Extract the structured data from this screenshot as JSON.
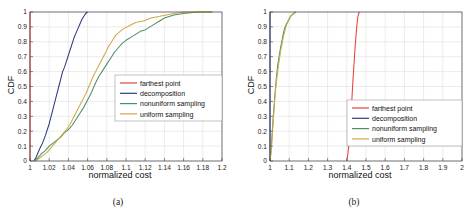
{
  "figure": {
    "subfigures": [
      {
        "caption": "(a)",
        "xlabel": "normalized cost",
        "ylabel": "CDF"
      },
      {
        "caption": "(b)",
        "xlabel": "normalized cost",
        "ylabel": "CDF"
      }
    ]
  },
  "colors": {
    "farthest_point": "#e8403a",
    "decomposition": "#2f3a7a",
    "nonuniform_sampling": "#4f8f62",
    "uniform_sampling": "#cfa94b",
    "axis": "#3f3f3f",
    "grid": "#d9d9d9",
    "background": "#ffffff"
  },
  "legend": {
    "entries": [
      {
        "label": "farthest point",
        "color_key": "farthest_point"
      },
      {
        "label": "decomposition",
        "color_key": "decomposition"
      },
      {
        "label": "nonuniform sampling",
        "color_key": "nonuniform_sampling"
      },
      {
        "label": "uniform sampling",
        "color_key": "uniform_sampling"
      }
    ]
  },
  "chart_data": [
    {
      "type": "line",
      "id": "subfigure-a",
      "title": "(a)",
      "xlabel": "normalized cost",
      "ylabel": "CDF",
      "xlim": [
        1,
        1.2
      ],
      "ylim": [
        0,
        1
      ],
      "grid": true,
      "legend_position": "center-right",
      "xticks": [
        1,
        1.02,
        1.04,
        1.06,
        1.08,
        1.1,
        1.12,
        1.14,
        1.16,
        1.18,
        1.2
      ],
      "xticklabels": [
        "1",
        "1.02",
        "1.04",
        "1.06",
        "1.08",
        "1.1",
        "1.12",
        "1.14",
        "1.16",
        "1.18",
        "1.2"
      ],
      "yticks": [
        0,
        0.1,
        0.2,
        0.3,
        0.4,
        0.5,
        0.6,
        0.7,
        0.8,
        0.9,
        1
      ],
      "yticklabels": [
        "0",
        "0.1",
        "0.2",
        "0.3",
        "0.4",
        "0.5",
        "0.6",
        "0.7",
        "0.8",
        "0.9",
        "1"
      ],
      "series": [
        {
          "name": "farthest point",
          "color": "#e8403a",
          "points": [
            [
              1,
              0
            ],
            [
              1,
              0.25
            ],
            [
              1,
              0.55
            ],
            [
              1,
              0.8
            ],
            [
              1,
              1
            ]
          ]
        },
        {
          "name": "decomposition",
          "color": "#2f3a7a",
          "points": [
            [
              1.004,
              0
            ],
            [
              1.006,
              0.02
            ],
            [
              1.008,
              0.05
            ],
            [
              1.01,
              0.08
            ],
            [
              1.013,
              0.12
            ],
            [
              1.016,
              0.17
            ],
            [
              1.018,
              0.21
            ],
            [
              1.02,
              0.25
            ],
            [
              1.022,
              0.3
            ],
            [
              1.024,
              0.35
            ],
            [
              1.026,
              0.4
            ],
            [
              1.028,
              0.45
            ],
            [
              1.03,
              0.5
            ],
            [
              1.032,
              0.55
            ],
            [
              1.034,
              0.6
            ],
            [
              1.036,
              0.63
            ],
            [
              1.038,
              0.67
            ],
            [
              1.04,
              0.71
            ],
            [
              1.042,
              0.75
            ],
            [
              1.044,
              0.79
            ],
            [
              1.046,
              0.83
            ],
            [
              1.048,
              0.86
            ],
            [
              1.05,
              0.89
            ],
            [
              1.052,
              0.92
            ],
            [
              1.054,
              0.95
            ],
            [
              1.056,
              0.97
            ],
            [
              1.058,
              0.99
            ],
            [
              1.06,
              1
            ]
          ]
        },
        {
          "name": "nonuniform sampling",
          "color": "#4f8f62",
          "points": [
            [
              1.004,
              0
            ],
            [
              1.008,
              0.02
            ],
            [
              1.012,
              0.05
            ],
            [
              1.016,
              0.07
            ],
            [
              1.02,
              0.1
            ],
            [
              1.024,
              0.12
            ],
            [
              1.028,
              0.14
            ],
            [
              1.032,
              0.16
            ],
            [
              1.036,
              0.19
            ],
            [
              1.04,
              0.21
            ],
            [
              1.044,
              0.24
            ],
            [
              1.048,
              0.28
            ],
            [
              1.052,
              0.32
            ],
            [
              1.056,
              0.36
            ],
            [
              1.06,
              0.41
            ],
            [
              1.064,
              0.46
            ],
            [
              1.068,
              0.52
            ],
            [
              1.072,
              0.57
            ],
            [
              1.076,
              0.61
            ],
            [
              1.08,
              0.65
            ],
            [
              1.084,
              0.69
            ],
            [
              1.088,
              0.73
            ],
            [
              1.092,
              0.76
            ],
            [
              1.096,
              0.79
            ],
            [
              1.1,
              0.81
            ],
            [
              1.105,
              0.83
            ],
            [
              1.11,
              0.85
            ],
            [
              1.115,
              0.87
            ],
            [
              1.12,
              0.88
            ],
            [
              1.125,
              0.9
            ],
            [
              1.13,
              0.92
            ],
            [
              1.135,
              0.94
            ],
            [
              1.14,
              0.96
            ],
            [
              1.15,
              0.98
            ],
            [
              1.16,
              0.99
            ],
            [
              1.175,
              1
            ],
            [
              1.19,
              1
            ]
          ]
        },
        {
          "name": "uniform sampling",
          "color": "#cfa94b",
          "points": [
            [
              1.006,
              0
            ],
            [
              1.01,
              0.02
            ],
            [
              1.014,
              0.04
            ],
            [
              1.018,
              0.06
            ],
            [
              1.022,
              0.09
            ],
            [
              1.026,
              0.12
            ],
            [
              1.03,
              0.15
            ],
            [
              1.034,
              0.18
            ],
            [
              1.038,
              0.21
            ],
            [
              1.042,
              0.25
            ],
            [
              1.046,
              0.3
            ],
            [
              1.05,
              0.35
            ],
            [
              1.054,
              0.4
            ],
            [
              1.058,
              0.45
            ],
            [
              1.062,
              0.51
            ],
            [
              1.066,
              0.57
            ],
            [
              1.07,
              0.62
            ],
            [
              1.074,
              0.67
            ],
            [
              1.078,
              0.72
            ],
            [
              1.082,
              0.77
            ],
            [
              1.086,
              0.81
            ],
            [
              1.09,
              0.85
            ],
            [
              1.094,
              0.87
            ],
            [
              1.098,
              0.89
            ],
            [
              1.104,
              0.91
            ],
            [
              1.11,
              0.93
            ],
            [
              1.118,
              0.94
            ],
            [
              1.126,
              0.96
            ],
            [
              1.134,
              0.97
            ],
            [
              1.142,
              0.98
            ],
            [
              1.15,
              0.99
            ],
            [
              1.16,
              1
            ],
            [
              1.19,
              1
            ]
          ]
        }
      ]
    },
    {
      "type": "line",
      "id": "subfigure-b",
      "title": "(b)",
      "xlabel": "normalized cost",
      "ylabel": "CDF",
      "xlim": [
        1,
        2
      ],
      "ylim": [
        0,
        1
      ],
      "grid": true,
      "legend_position": "lower-right",
      "xticks": [
        1,
        1.1,
        1.2,
        1.3,
        1.4,
        1.5,
        1.6,
        1.7,
        1.8,
        1.9,
        2
      ],
      "xticklabels": [
        "1",
        "1.1",
        "1.2",
        "1.3",
        "1.4",
        "1.5",
        "1.6",
        "1.7",
        "1.8",
        "1.9",
        "2"
      ],
      "yticks": [
        0,
        0.1,
        0.2,
        0.3,
        0.4,
        0.5,
        0.6,
        0.7,
        0.8,
        0.9,
        1
      ],
      "yticklabels": [
        "0",
        "0.1",
        "0.2",
        "0.3",
        "0.4",
        "0.5",
        "0.6",
        "0.7",
        "0.8",
        "0.9",
        "1"
      ],
      "series": [
        {
          "name": "farthest point",
          "color": "#e8403a",
          "points": [
            [
              1.4,
              0
            ],
            [
              1.405,
              0.04
            ],
            [
              1.41,
              0.1
            ],
            [
              1.414,
              0.17
            ],
            [
              1.418,
              0.24
            ],
            [
              1.422,
              0.31
            ],
            [
              1.425,
              0.38
            ],
            [
              1.428,
              0.45
            ],
            [
              1.431,
              0.52
            ],
            [
              1.434,
              0.58
            ],
            [
              1.437,
              0.64
            ],
            [
              1.44,
              0.7
            ],
            [
              1.443,
              0.76
            ],
            [
              1.446,
              0.81
            ],
            [
              1.449,
              0.86
            ],
            [
              1.452,
              0.9
            ],
            [
              1.455,
              0.94
            ],
            [
              1.458,
              0.97
            ],
            [
              1.462,
              0.99
            ],
            [
              1.466,
              1
            ]
          ]
        },
        {
          "name": "decomposition",
          "color": "#2f3a7a",
          "points": [
            [
              1,
              0
            ],
            [
              1,
              0.25
            ],
            [
              1,
              0.55
            ],
            [
              1,
              0.8
            ],
            [
              1,
              1
            ]
          ]
        },
        {
          "name": "nonuniform sampling",
          "color": "#4f8f62",
          "points": [
            [
              1.0,
              0
            ],
            [
              1.004,
              0.05
            ],
            [
              1.008,
              0.12
            ],
            [
              1.012,
              0.2
            ],
            [
              1.016,
              0.28
            ],
            [
              1.02,
              0.35
            ],
            [
              1.024,
              0.42
            ],
            [
              1.028,
              0.48
            ],
            [
              1.032,
              0.54
            ],
            [
              1.036,
              0.59
            ],
            [
              1.04,
              0.64
            ],
            [
              1.046,
              0.69
            ],
            [
              1.052,
              0.74
            ],
            [
              1.058,
              0.78
            ],
            [
              1.064,
              0.82
            ],
            [
              1.07,
              0.86
            ],
            [
              1.076,
              0.89
            ],
            [
              1.082,
              0.91
            ],
            [
              1.09,
              0.93
            ],
            [
              1.098,
              0.95
            ],
            [
              1.106,
              0.97
            ],
            [
              1.114,
              0.98
            ],
            [
              1.124,
              0.99
            ],
            [
              1.134,
              1
            ]
          ]
        },
        {
          "name": "uniform sampling",
          "color": "#cfa94b",
          "points": [
            [
              1.0,
              0
            ],
            [
              1.005,
              0.05
            ],
            [
              1.01,
              0.13
            ],
            [
              1.014,
              0.21
            ],
            [
              1.018,
              0.29
            ],
            [
              1.022,
              0.36
            ],
            [
              1.026,
              0.43
            ],
            [
              1.03,
              0.49
            ],
            [
              1.035,
              0.55
            ],
            [
              1.04,
              0.6
            ],
            [
              1.045,
              0.65
            ],
            [
              1.051,
              0.7
            ],
            [
              1.057,
              0.75
            ],
            [
              1.063,
              0.79
            ],
            [
              1.069,
              0.83
            ],
            [
              1.075,
              0.86
            ],
            [
              1.081,
              0.89
            ],
            [
              1.088,
              0.92
            ],
            [
              1.096,
              0.94
            ],
            [
              1.104,
              0.96
            ],
            [
              1.112,
              0.98
            ],
            [
              1.122,
              0.99
            ],
            [
              1.132,
              1
            ]
          ]
        }
      ]
    }
  ]
}
